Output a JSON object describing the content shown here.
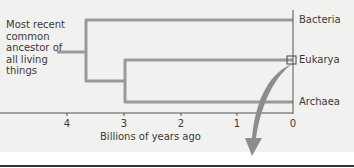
{
  "diagram": {
    "ancestor_label": "Most recent common ancestor of all living things",
    "taxa": [
      {
        "name": "Bacteria"
      },
      {
        "name": "Eukarya"
      },
      {
        "name": "Archaea"
      }
    ],
    "axis": {
      "label": "Billions of years ago",
      "ticks": [
        "4",
        "3",
        "2",
        "1",
        "0"
      ]
    },
    "colors": {
      "branch": "#9a9a98",
      "axis": "#555555",
      "arrow": "#8d8d8b",
      "background": "#f1f1ef"
    }
  }
}
